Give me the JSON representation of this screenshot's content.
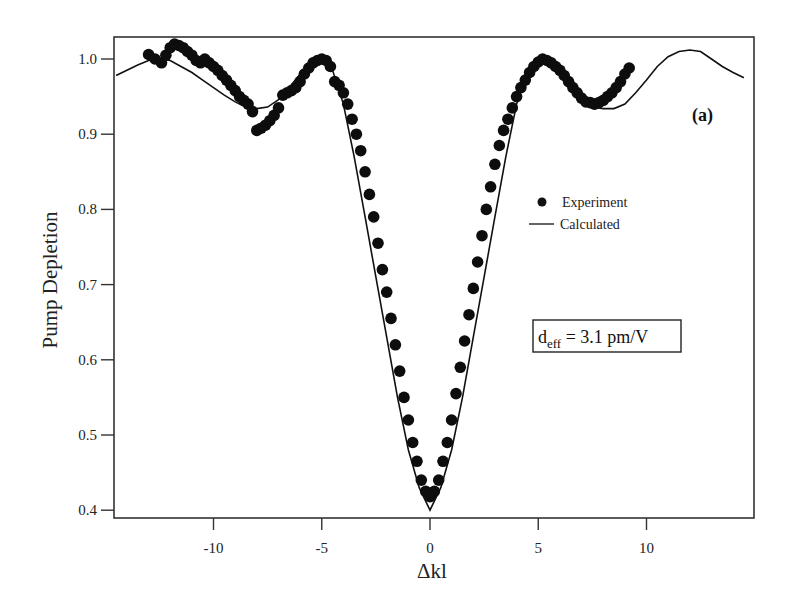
{
  "chart_data": {
    "type": "scatter",
    "title": "",
    "panel_label": "(a)",
    "xlabel": "Δkl",
    "ylabel": "Pump Depletion",
    "xlim": [
      -14.5,
      14.5
    ],
    "ylim": [
      0.39,
      1.03
    ],
    "x_ticks": [
      -10,
      -5,
      0,
      5,
      10
    ],
    "x_tick_labels": [
      "-10",
      "-5",
      "0",
      "5",
      "10"
    ],
    "y_ticks": [
      0.4,
      0.5,
      0.6,
      0.7,
      0.8,
      0.9,
      1.0
    ],
    "y_tick_labels": [
      "0.4",
      "0.5",
      "0.6",
      "0.7",
      "0.8",
      "0.9",
      "1.0"
    ],
    "grid": false,
    "legend_position": "right-center",
    "legend": [
      {
        "label": "Experiment",
        "marker": "filled-circle"
      },
      {
        "label": "Calculated",
        "marker": "line"
      }
    ],
    "annotation": {
      "main": "d",
      "subscript": "eff",
      "rest": " = 3.1 pm/V"
    },
    "series": [
      {
        "name": "Calculated",
        "type": "line",
        "x": [
          -14.5,
          -14.0,
          -13.5,
          -13.0,
          -12.5,
          -12.0,
          -11.5,
          -11.0,
          -10.5,
          -10.0,
          -9.5,
          -9.0,
          -8.5,
          -8.0,
          -7.5,
          -7.0,
          -6.5,
          -6.0,
          -5.5,
          -5.0,
          -4.5,
          -4.0,
          -3.5,
          -3.0,
          -2.5,
          -2.0,
          -1.5,
          -1.0,
          -0.5,
          0.0,
          0.5,
          1.0,
          1.5,
          2.0,
          2.5,
          3.0,
          3.5,
          4.0,
          4.5,
          5.0,
          5.5,
          6.0,
          6.5,
          7.0,
          7.5,
          8.0,
          8.5,
          9.0,
          9.5,
          10.0,
          10.5,
          11.0,
          11.5,
          12.0,
          12.5,
          13.0,
          13.5,
          14.0,
          14.5
        ],
        "y": [
          0.978,
          0.985,
          0.992,
          0.998,
          1.0,
          0.998,
          0.99,
          0.982,
          0.972,
          0.962,
          0.952,
          0.943,
          0.936,
          0.934,
          0.936,
          0.946,
          0.962,
          0.98,
          0.995,
          1.0,
          0.985,
          0.94,
          0.87,
          0.79,
          0.71,
          0.63,
          0.55,
          0.48,
          0.43,
          0.4,
          0.43,
          0.48,
          0.55,
          0.63,
          0.71,
          0.79,
          0.87,
          0.94,
          0.985,
          1.0,
          0.995,
          0.98,
          0.962,
          0.946,
          0.936,
          0.934,
          0.934,
          0.94,
          0.955,
          0.972,
          0.99,
          1.003,
          1.01,
          1.012,
          1.01,
          1.0,
          0.99,
          0.982,
          0.975
        ]
      },
      {
        "name": "Experiment",
        "type": "scatter",
        "x": [
          -13.0,
          -12.7,
          -12.4,
          -12.2,
          -12.0,
          -11.8,
          -11.6,
          -11.4,
          -11.2,
          -11.0,
          -10.8,
          -10.6,
          -10.4,
          -10.2,
          -10.0,
          -9.8,
          -9.6,
          -9.4,
          -9.2,
          -9.0,
          -8.8,
          -8.6,
          -8.4,
          -8.2,
          -8.0,
          -7.8,
          -7.6,
          -7.4,
          -7.2,
          -7.0,
          -6.8,
          -6.6,
          -6.4,
          -6.2,
          -6.0,
          -5.8,
          -5.6,
          -5.4,
          -5.2,
          -5.0,
          -4.8,
          -4.6,
          -4.4,
          -4.2,
          -4.0,
          -3.8,
          -3.6,
          -3.4,
          -3.2,
          -3.0,
          -2.8,
          -2.6,
          -2.4,
          -2.2,
          -2.0,
          -1.8,
          -1.6,
          -1.4,
          -1.2,
          -1.0,
          -0.8,
          -0.6,
          -0.4,
          -0.2,
          0.0,
          0.2,
          0.4,
          0.6,
          0.8,
          1.0,
          1.2,
          1.4,
          1.6,
          1.8,
          2.0,
          2.2,
          2.4,
          2.6,
          2.8,
          3.0,
          3.2,
          3.4,
          3.6,
          3.8,
          4.0,
          4.2,
          4.4,
          4.6,
          4.8,
          5.0,
          5.2,
          5.4,
          5.6,
          5.8,
          6.0,
          6.2,
          6.4,
          6.6,
          6.8,
          7.0,
          7.2,
          7.4,
          7.6,
          7.8,
          8.0,
          8.2,
          8.4,
          8.6,
          8.8,
          9.0,
          9.2
        ],
        "y": [
          1.006,
          1.0,
          0.995,
          1.005,
          1.015,
          1.02,
          1.018,
          1.015,
          1.01,
          1.005,
          0.998,
          0.995,
          1.0,
          0.995,
          0.99,
          0.985,
          0.978,
          0.972,
          0.965,
          0.958,
          0.95,
          0.945,
          0.94,
          0.93,
          0.905,
          0.908,
          0.912,
          0.918,
          0.925,
          0.935,
          0.952,
          0.955,
          0.958,
          0.962,
          0.97,
          0.98,
          0.988,
          0.995,
          0.998,
          1.0,
          0.998,
          0.99,
          0.97,
          0.965,
          0.955,
          0.94,
          0.92,
          0.9,
          0.878,
          0.85,
          0.82,
          0.79,
          0.755,
          0.72,
          0.69,
          0.655,
          0.62,
          0.585,
          0.55,
          0.52,
          0.49,
          0.465,
          0.44,
          0.425,
          0.418,
          0.425,
          0.44,
          0.465,
          0.49,
          0.52,
          0.555,
          0.59,
          0.625,
          0.66,
          0.695,
          0.73,
          0.765,
          0.8,
          0.83,
          0.86,
          0.885,
          0.905,
          0.92,
          0.935,
          0.95,
          0.962,
          0.972,
          0.982,
          0.99,
          0.996,
          1.0,
          0.998,
          0.995,
          0.99,
          0.985,
          0.978,
          0.97,
          0.962,
          0.955,
          0.948,
          0.943,
          0.942,
          0.94,
          0.942,
          0.945,
          0.95,
          0.955,
          0.962,
          0.97,
          0.98,
          0.988
        ]
      }
    ]
  },
  "colors": {
    "background": "#ffffff",
    "ink": "#111111",
    "frame": "#333333"
  }
}
